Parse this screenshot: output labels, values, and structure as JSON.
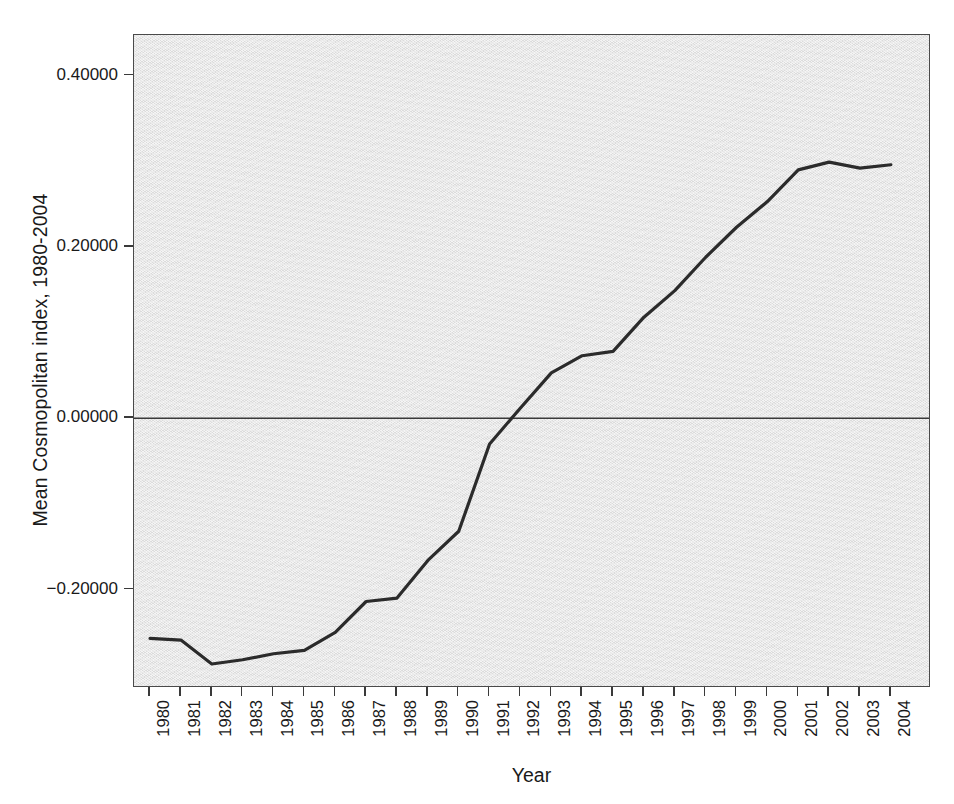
{
  "chart_data": {
    "type": "line",
    "title": "",
    "xlabel": "Year",
    "ylabel": "Mean Cosmopolitan index, 1980-2004",
    "categories": [
      "1980",
      "1981",
      "1982",
      "1983",
      "1984",
      "1985",
      "1986",
      "1987",
      "1988",
      "1989",
      "1990",
      "1991",
      "1992",
      "1993",
      "1994",
      "1995",
      "1996",
      "1997",
      "1998",
      "1999",
      "2000",
      "2001",
      "2002",
      "2003",
      "2004"
    ],
    "x": [
      1980,
      1981,
      1982,
      1983,
      1984,
      1985,
      1986,
      1987,
      1988,
      1989,
      1990,
      1991,
      1992,
      1993,
      1994,
      1995,
      1996,
      1997,
      1998,
      1999,
      2000,
      2001,
      2002,
      2003,
      2004
    ],
    "values": [
      -0.257,
      -0.259,
      -0.287,
      -0.282,
      -0.275,
      -0.271,
      -0.25,
      -0.214,
      -0.21,
      -0.166,
      -0.132,
      -0.03,
      0.012,
      0.053,
      0.073,
      0.078,
      0.118,
      0.149,
      0.188,
      0.223,
      0.253,
      0.29,
      0.299,
      0.292,
      0.296
    ],
    "series": [
      {
        "name": "Mean Cosmopolitan index",
        "values": [
          -0.257,
          -0.259,
          -0.287,
          -0.282,
          -0.275,
          -0.271,
          -0.25,
          -0.214,
          -0.21,
          -0.166,
          -0.132,
          -0.03,
          0.012,
          0.053,
          0.073,
          0.078,
          0.118,
          0.149,
          0.188,
          0.223,
          0.253,
          0.29,
          0.299,
          0.292,
          0.296
        ]
      }
    ],
    "y_ticks": [
      0.4,
      0.2,
      0.0,
      -0.2
    ],
    "y_tick_labels": [
      "0.40000",
      "0.20000",
      "0.00000",
      "−0.20000"
    ],
    "ylim": [
      -0.315,
      0.4475
    ],
    "xlim": [
      1979.48,
      2005.3
    ],
    "grid": false,
    "legend": false,
    "zero_reference_line": 0.0,
    "line_color": "#2b2b2b",
    "plot_background_color": "#e3e3e3",
    "axis_color": "#4a4a4a",
    "line_width": 3.2
  },
  "axes": {
    "y_title": "Mean Cosmopolitan index, 1980-2004",
    "x_title": "Year"
  }
}
